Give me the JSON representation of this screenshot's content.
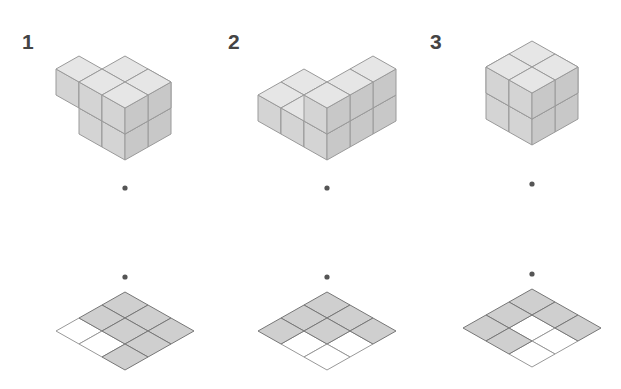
{
  "figures": [
    {
      "label": "1",
      "label_pos": [
        22,
        30
      ],
      "origin": [
        125,
        160
      ],
      "cubes": [
        [
          0,
          0,
          0
        ],
        [
          1,
          0,
          0
        ],
        [
          0,
          1,
          0
        ],
        [
          1,
          1,
          0
        ],
        [
          2,
          1,
          0
        ],
        [
          0,
          0,
          1
        ],
        [
          1,
          0,
          1
        ],
        [
          0,
          1,
          1
        ],
        [
          1,
          1,
          1
        ],
        [
          0,
          2,
          1
        ]
      ],
      "dot_top": [
        125,
        188
      ],
      "dot_bottom": [
        125,
        277
      ],
      "grid_origin": [
        125,
        292
      ],
      "grid_shaded": [
        [
          1,
          1,
          1
        ],
        [
          1,
          1,
          1
        ],
        [
          0,
          0,
          1
        ]
      ]
    },
    {
      "label": "2",
      "label_pos": [
        228,
        30
      ],
      "origin": [
        327,
        160
      ],
      "cubes": [
        [
          0,
          0,
          0
        ],
        [
          1,
          0,
          0
        ],
        [
          2,
          0,
          0
        ],
        [
          0,
          0,
          1
        ],
        [
          1,
          0,
          1
        ],
        [
          2,
          0,
          1
        ],
        [
          0,
          1,
          0
        ],
        [
          1,
          1,
          0
        ],
        [
          0,
          2,
          0
        ],
        [
          1,
          2,
          0
        ]
      ],
      "dot_top": [
        327,
        188
      ],
      "dot_bottom": [
        327,
        277
      ],
      "grid_origin": [
        327,
        292
      ],
      "grid_shaded": [
        [
          1,
          1,
          1
        ],
        [
          1,
          1,
          0
        ],
        [
          1,
          0,
          0
        ]
      ]
    },
    {
      "label": "3",
      "label_pos": [
        430,
        30
      ],
      "origin": [
        532,
        145
      ],
      "cubes": [
        [
          0,
          0,
          0
        ],
        [
          1,
          0,
          0
        ],
        [
          0,
          1,
          0
        ],
        [
          1,
          1,
          0
        ],
        [
          0,
          0,
          1
        ],
        [
          1,
          0,
          1
        ],
        [
          0,
          1,
          1
        ],
        [
          1,
          1,
          1
        ],
        [
          2,
          1,
          0
        ],
        [
          1,
          2,
          0
        ]
      ],
      "dot_top": [
        532,
        184
      ],
      "dot_bottom": [
        532,
        274
      ],
      "grid_origin": [
        532,
        289
      ],
      "grid_shaded": [
        [
          1,
          1,
          1
        ],
        [
          1,
          0,
          0
        ],
        [
          1,
          1,
          0
        ]
      ]
    }
  ],
  "colors": {
    "top": "#e6e6e6",
    "left": "#d4d4d4",
    "right": "#c8c8c8",
    "edge": "#9a9a9a",
    "grid_fill": "#cfcfcf",
    "grid_edge": "#777777",
    "dot": "#555555",
    "label": "#444444"
  },
  "iso": {
    "dx": 23,
    "dy": 13,
    "h": 26
  }
}
